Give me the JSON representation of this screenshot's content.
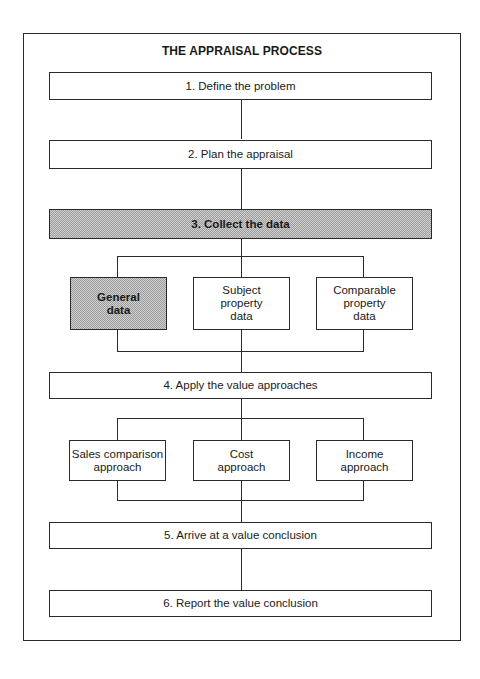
{
  "title": "THE APPRAISAL PROCESS",
  "steps": [
    {
      "label": "1. Define the problem",
      "shaded": false
    },
    {
      "label": "2.  Plan the appraisal",
      "shaded": false
    },
    {
      "label": "3.  Collect the data",
      "shaded": true
    },
    {
      "label": "4.  Apply the value approaches",
      "shaded": false
    },
    {
      "label": "5.  Arrive at a value conclusion",
      "shaded": false
    },
    {
      "label": "6.  Report the value conclusion",
      "shaded": false
    }
  ],
  "data_types": [
    {
      "line1": "General",
      "line2": "data",
      "line3": "",
      "shaded": true
    },
    {
      "line1": "Subject",
      "line2": "property",
      "line3": "data",
      "shaded": false
    },
    {
      "line1": "Comparable",
      "line2": "property",
      "line3": "data",
      "shaded": false
    }
  ],
  "approaches": [
    {
      "line1": "Sales comparison",
      "line2": "approach"
    },
    {
      "line1": "Cost",
      "line2": "approach"
    },
    {
      "line1": "Income",
      "line2": "approach"
    }
  ],
  "colors": {
    "line": "#2a2a2a",
    "shade": "#c8c8c8",
    "background": "#ffffff"
  }
}
